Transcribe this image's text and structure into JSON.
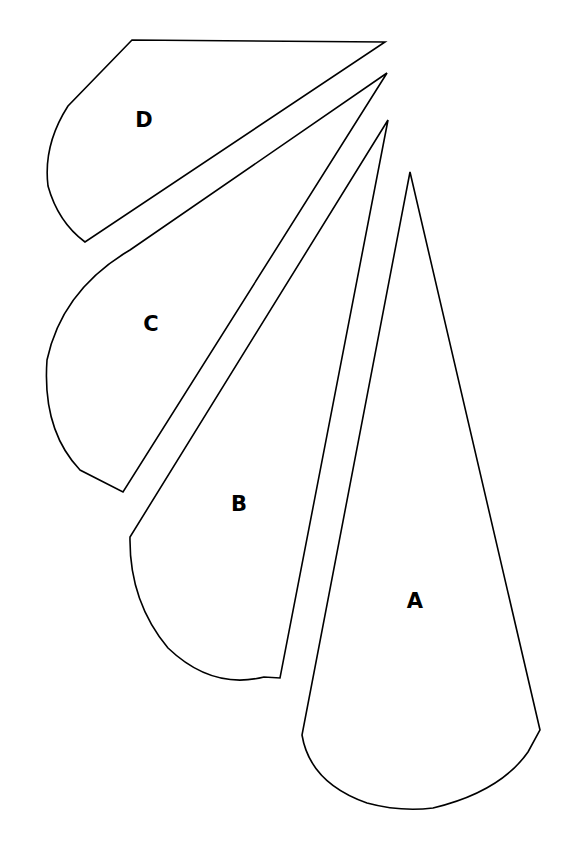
{
  "figure": {
    "background_color": "#ffffff",
    "stroke_color": "#000000",
    "width": 571,
    "height": 848,
    "pieces": [
      {
        "id": "A",
        "label": "A",
        "label_x": 415,
        "label_y": 601,
        "apex_x": 410,
        "apex_y": 172,
        "path": "M 410 172 L 302 735 Q 310 783 367 803 Q 400 812 433 808 Q 500 792 528 752 L 540 730 Z"
      },
      {
        "id": "B",
        "label": "B",
        "label_x": 239,
        "label_y": 504,
        "apex_x": 388,
        "apex_y": 120,
        "path": "M 388 120 L 130 537 Q 129 601 168 648 Q 212 690 264 677 L 280 678 Z"
      },
      {
        "id": "C",
        "label": "C",
        "label_x": 151,
        "label_y": 324,
        "apex_x": 387,
        "apex_y": 73,
        "path": "M 387 73 L 130 250 Q 62 290 47 360 Q 42 430 80 470 L 123 492 Z"
      },
      {
        "id": "D",
        "label": "D",
        "label_x": 144,
        "label_y": 120,
        "apex_x": 385,
        "apex_y": 42,
        "path": "M 385 42 L 132 40 L 68 106 Q 43 145 48 186 Q 58 222 85 242 Z"
      }
    ]
  }
}
